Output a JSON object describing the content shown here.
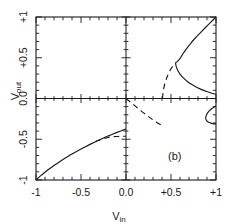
{
  "chart_data": {
    "type": "line",
    "title": "",
    "subtitle": "",
    "xlabel": "V_in",
    "ylabel": "V_out",
    "annotation": "(b)",
    "xlim": [
      -1,
      1
    ],
    "ylim": [
      -1,
      1
    ],
    "grid": false,
    "legend_position": "none",
    "xticks": [
      -1,
      -0.5,
      0,
      0.5,
      1
    ],
    "xticklabels": [
      "-1",
      "-0.5",
      "0.0",
      "+0.5",
      "+1"
    ],
    "yticks": [
      -1,
      -0.5,
      0,
      0.5,
      1
    ],
    "yticklabels": [
      "-1",
      "-0.5",
      "0.0",
      "+0.5",
      "+1"
    ],
    "minor_tick_step": 0.1,
    "series": [
      {
        "name": "lower-stable-branch",
        "style": "solid",
        "color": "#1a1a1a",
        "points": [
          [
            -1.0,
            -1.0
          ],
          [
            -0.95,
            -0.95
          ],
          [
            -0.9,
            -0.905
          ],
          [
            -0.85,
            -0.862
          ],
          [
            -0.8,
            -0.822
          ],
          [
            -0.75,
            -0.784
          ],
          [
            -0.7,
            -0.748
          ],
          [
            -0.65,
            -0.714
          ],
          [
            -0.6,
            -0.681
          ],
          [
            -0.55,
            -0.65
          ],
          [
            -0.5,
            -0.62
          ],
          [
            -0.45,
            -0.591
          ],
          [
            -0.4,
            -0.563
          ],
          [
            -0.35,
            -0.536
          ],
          [
            -0.3,
            -0.51
          ],
          [
            -0.25,
            -0.485
          ],
          [
            -0.2,
            -0.461
          ],
          [
            -0.15,
            -0.438
          ],
          [
            -0.1,
            -0.416
          ],
          [
            -0.05,
            -0.395
          ],
          [
            0.0,
            -0.375
          ]
        ]
      },
      {
        "name": "lower-unstable-branch",
        "style": "dashed",
        "color": "#1a1a1a",
        "points": [
          [
            -0.34,
            -0.528
          ],
          [
            -0.3,
            -0.512
          ],
          [
            -0.25,
            -0.492
          ],
          [
            -0.2,
            -0.478
          ],
          [
            -0.15,
            -0.47
          ],
          [
            -0.1,
            -0.466
          ],
          [
            -0.05,
            -0.464
          ],
          [
            0.0,
            -0.463
          ]
        ]
      },
      {
        "name": "origin-unstable-branch",
        "style": "dashed",
        "color": "#1a1a1a",
        "points": [
          [
            0.0,
            0.0
          ],
          [
            0.05,
            -0.045
          ],
          [
            0.1,
            -0.09
          ],
          [
            0.15,
            -0.135
          ],
          [
            0.2,
            -0.18
          ],
          [
            0.25,
            -0.222
          ],
          [
            0.3,
            -0.262
          ],
          [
            0.35,
            -0.3
          ],
          [
            0.4,
            -0.33
          ]
        ]
      },
      {
        "name": "upper-unstable-branch",
        "style": "dashed",
        "color": "#1a1a1a",
        "points": [
          [
            0.405,
            0.0
          ],
          [
            0.41,
            0.055
          ],
          [
            0.418,
            0.115
          ],
          [
            0.43,
            0.175
          ],
          [
            0.447,
            0.235
          ],
          [
            0.468,
            0.295
          ],
          [
            0.495,
            0.355
          ],
          [
            0.525,
            0.405
          ],
          [
            0.552,
            0.437
          ]
        ]
      },
      {
        "name": "upper-stable-branch",
        "style": "solid",
        "color": "#1a1a1a",
        "points": [
          [
            1.0,
            1.0
          ],
          [
            0.94,
            0.935
          ],
          [
            0.88,
            0.868
          ],
          [
            0.82,
            0.8
          ],
          [
            0.76,
            0.73
          ],
          [
            0.71,
            0.665
          ],
          [
            0.665,
            0.6
          ],
          [
            0.625,
            0.535
          ],
          [
            0.592,
            0.48
          ],
          [
            0.566,
            0.45
          ],
          [
            0.552,
            0.437
          ],
          [
            0.556,
            0.4
          ],
          [
            0.573,
            0.35
          ],
          [
            0.6,
            0.3
          ],
          [
            0.64,
            0.25
          ],
          [
            0.692,
            0.2
          ],
          [
            0.755,
            0.155
          ],
          [
            0.828,
            0.115
          ],
          [
            0.905,
            0.082
          ],
          [
            0.975,
            0.058
          ],
          [
            1.0,
            0.05
          ]
        ]
      },
      {
        "name": "right-hook-branch",
        "style": "solid",
        "color": "#1a1a1a",
        "points": [
          [
            1.0,
            -0.09
          ],
          [
            0.965,
            -0.115
          ],
          [
            0.93,
            -0.145
          ],
          [
            0.905,
            -0.18
          ],
          [
            0.89,
            -0.215
          ],
          [
            0.886,
            -0.245
          ],
          [
            0.895,
            -0.272
          ],
          [
            0.918,
            -0.292
          ],
          [
            0.95,
            -0.305
          ],
          [
            0.985,
            -0.312
          ],
          [
            1.0,
            -0.314
          ]
        ]
      }
    ]
  },
  "labels": {
    "y_axis_text": "V",
    "y_axis_sub": "out",
    "x_axis_text": "V",
    "x_axis_sub": "in",
    "panel_tag": "(b)"
  }
}
